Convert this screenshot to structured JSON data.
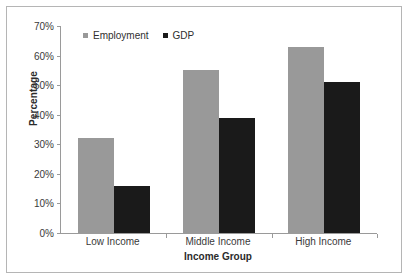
{
  "chart_data": {
    "type": "bar",
    "title": "",
    "categories": [
      "Low Income",
      "Middle Income",
      "High Income"
    ],
    "series": [
      {
        "name": "Employment",
        "values": [
          32,
          55,
          63
        ],
        "color": "#999999"
      },
      {
        "name": "GDP",
        "values": [
          16,
          39,
          51
        ],
        "color": "#1a1a1a"
      }
    ],
    "xlabel": "Income Group",
    "ylabel": "Percentage",
    "ylim": [
      0,
      70
    ],
    "ytick_step": 10,
    "ytick_labels": [
      "0%",
      "10%",
      "20%",
      "30%",
      "40%",
      "50%",
      "60%",
      "70%"
    ],
    "grid": false,
    "legend_position": "top-left-inside",
    "value_suffix": "%"
  },
  "axis": {
    "y_title": "Percentage",
    "x_title": "Income Group"
  },
  "legend": {
    "items": [
      {
        "label": "Employment",
        "color": "#999999"
      },
      {
        "label": "GDP",
        "color": "#1a1a1a"
      }
    ]
  },
  "colors": {
    "employment": "#999999",
    "gdp": "#1a1a1a",
    "axis": "#9a9a9a",
    "border": "#b5b5b5",
    "background": "#ffffff"
  }
}
